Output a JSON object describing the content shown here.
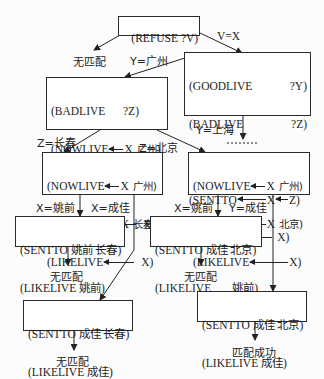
{
  "diagram": {
    "type": "search-tree",
    "nodes": {
      "root": {
        "line1": "(REFUSE ?V)"
      },
      "n1": {
        "rows": [
          [
            "(GOODLIVE",
            "?Y)"
          ],
          [
            "(BADLIVE",
            "?Z)"
          ],
          [
            "(NOWLIVE",
            "X",
            "Y)"
          ],
          [
            "(SENTTO",
            "X",
            "Z)"
          ],
          [
            "(LIKELIVE",
            "X)"
          ]
        ]
      },
      "n2": {
        "rows": [
          [
            "(BADLIVE",
            "?Z)"
          ],
          [
            "(NOWLIVE",
            "X",
            "广州)"
          ],
          [
            "(SENTTO",
            "X",
            "Z)"
          ],
          [
            "(LIKELIKE",
            "X)"
          ]
        ]
      },
      "n3": {
        "rows": [
          [
            "(NOWLIVE",
            "X",
            "广州)"
          ],
          [
            "(SENTTO",
            "X",
            "长春)"
          ],
          [
            "(LIKELIVE",
            "X)"
          ]
        ]
      },
      "n4": {
        "rows": [
          [
            "(NOWLIVE",
            "X",
            "广州)"
          ],
          [
            "(SENTTO",
            "X",
            "北京)"
          ],
          [
            "(LIKELIVE",
            "X)"
          ]
        ]
      },
      "n5": {
        "line1": "(SENTTO 姚前 长春)",
        "line2": "(LIKELIVE 姚前)"
      },
      "n6": {
        "line1": "(SENTTO 成佳 北京)",
        "line2a": "(LIKELIVE",
        "line2b": "姚前)"
      },
      "n7": {
        "line1": "(SENTTO 成佳 长春)",
        "line2": "(LIKELIVE 成佳)"
      },
      "n8": {
        "line1": "(SENTTO 成佳 北京)",
        "line2": "(LIKELIVE 成佳)"
      }
    },
    "edge_labels": {
      "v_eq_x": "V=X",
      "y_guangzhou": "Y=广州",
      "y_shanghai": "Y=上海",
      "z_changchun": "Z=长春",
      "z_beijing": "Z=北京",
      "x_yaoqian_left": "X=姚前",
      "x_chengjia_left": "X=成佳",
      "x_yaoqian_right": "X=姚前",
      "y_chengjia_right": "Y=成佳"
    },
    "outcomes": {
      "no_match_root": "无匹配",
      "no_match_n5": "无匹配",
      "no_match_n6": "无匹配",
      "no_match_n7": "无匹配",
      "match_success": "匹配成功"
    },
    "colors": {
      "line": "#222222",
      "text": "#1c1c1c",
      "background": "#fcfcfc"
    }
  }
}
